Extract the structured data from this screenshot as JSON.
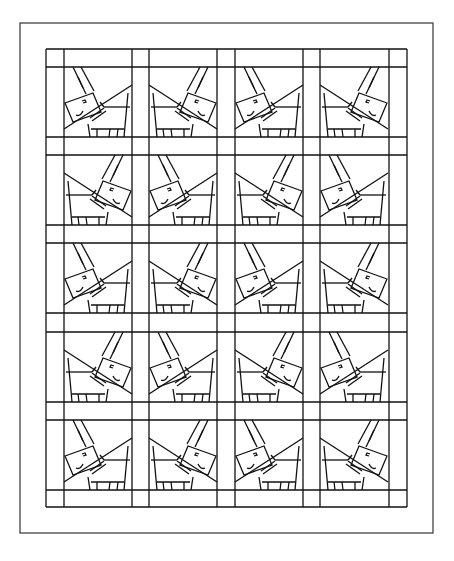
{
  "canvas": {
    "width": 454,
    "height": 561,
    "background": "#ffffff",
    "line_color": "#111111"
  },
  "outer_border": {
    "x": 20,
    "y": 23,
    "width": 413,
    "height": 510
  },
  "grid": {
    "x": 46,
    "y": 49,
    "width": 361,
    "height": 458,
    "column_lines": [
      46,
      64,
      132,
      149,
      217,
      235,
      303,
      320,
      389,
      407
    ],
    "row_lines": [
      49,
      67,
      137,
      155,
      225,
      243,
      313,
      332,
      402,
      420,
      490,
      507
    ]
  },
  "block_size": {
    "width": 68,
    "height": 70
  },
  "blocks": {
    "columns_x": [
      64,
      149,
      235,
      320
    ],
    "rows_y": [
      67,
      155,
      243,
      332,
      420
    ],
    "orientation_legend": {
      "L": "donkey head on left",
      "R": "donkey head on right"
    },
    "orientation": [
      [
        "L",
        "R",
        "L",
        "R"
      ],
      [
        "R",
        "L",
        "R",
        "L"
      ],
      [
        "L",
        "R",
        "L",
        "R"
      ],
      [
        "R",
        "L",
        "R",
        "L"
      ],
      [
        "L",
        "R",
        "L",
        "R"
      ]
    ]
  }
}
